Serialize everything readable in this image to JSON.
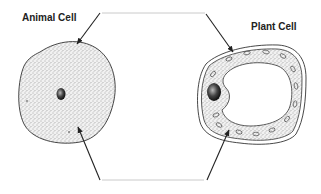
{
  "diagram": {
    "labels": {
      "animal": "Animal Cell",
      "plant": "Plant Cell"
    },
    "colors": {
      "outline": "#333333",
      "connector": "#bbbbbb",
      "stipple": "#555555",
      "background": "#ffffff"
    },
    "pointers": [
      {
        "name": "animal-cell-membrane-pointer",
        "from": [
          100,
          13
        ],
        "to": [
          77,
          44
        ]
      },
      {
        "name": "plant-cell-wall-pointer",
        "from": [
          206,
          14
        ],
        "to": [
          233,
          52
        ]
      },
      {
        "name": "animal-cytoplasm-pointer",
        "from": [
          100,
          180
        ],
        "to": [
          78,
          127
        ]
      },
      {
        "name": "plant-cytoplasm-pointer",
        "from": [
          207,
          180
        ],
        "to": [
          229,
          130
        ]
      }
    ],
    "connectors": [
      {
        "name": "top-connector-line",
        "y": 13,
        "x1": 102,
        "x2": 205
      },
      {
        "name": "bottom-connector-line",
        "y": 180,
        "x1": 102,
        "x2": 204
      }
    ]
  }
}
